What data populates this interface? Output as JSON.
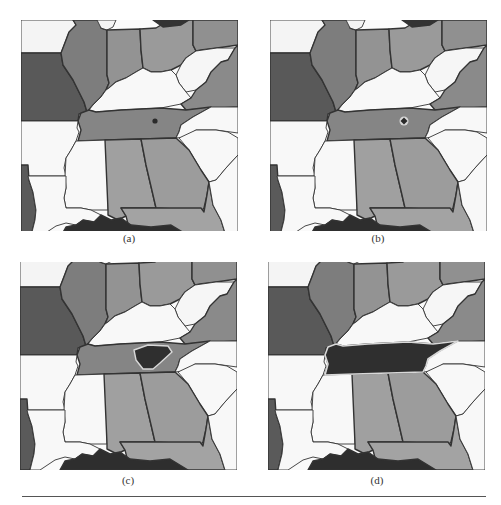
{
  "figure": {
    "panels": [
      {
        "id": "a",
        "caption": "(a)",
        "state_of_interaction": "point marker placed in Tennessee",
        "marker": "dot"
      },
      {
        "id": "b",
        "caption": "(b)",
        "state_of_interaction": "point marker highlighted",
        "marker": "ringed-diamond"
      },
      {
        "id": "c",
        "caption": "(c)",
        "state_of_interaction": "partial region grown inside Tennessee",
        "marker": "partial-region"
      },
      {
        "id": "d",
        "caption": "(d)",
        "state_of_interaction": "full Tennessee region selected and outlined",
        "marker": "full-region"
      }
    ]
  },
  "map": {
    "states": [
      {
        "name": "northwest-white",
        "shade": "#f4f4f4"
      },
      {
        "name": "missouri",
        "shade": "#595959"
      },
      {
        "name": "illinois",
        "shade": "#7d7d7d"
      },
      {
        "name": "lake-michigan",
        "shade": "#f4f4f4"
      },
      {
        "name": "indiana",
        "shade": "#939393"
      },
      {
        "name": "ohio",
        "shade": "#9a9a9a"
      },
      {
        "name": "lake-erie",
        "shade": "#333333"
      },
      {
        "name": "pennsylvania",
        "shade": "#909090"
      },
      {
        "name": "west-virginia",
        "shade": "#f6f6f6"
      },
      {
        "name": "kentucky",
        "shade": "#f8f8f8"
      },
      {
        "name": "virginia",
        "shade": "#8a8a8a"
      },
      {
        "name": "tennessee",
        "shade": "#858585"
      },
      {
        "name": "north-carolina",
        "shade": "#f8f8f8"
      },
      {
        "name": "south-carolina",
        "shade": "#f8f8f8"
      },
      {
        "name": "arkansas",
        "shade": "#f8f8f8"
      },
      {
        "name": "mississippi",
        "shade": "#f8f8f8"
      },
      {
        "name": "alabama",
        "shade": "#a0a0a0"
      },
      {
        "name": "georgia",
        "shade": "#9c9c9c"
      },
      {
        "name": "florida",
        "shade": "#a3a3a3"
      },
      {
        "name": "atlantic",
        "shade": "#f8f8f8"
      },
      {
        "name": "texas",
        "shade": "#5a5a5a"
      },
      {
        "name": "louisiana",
        "shade": "#f8f8f8"
      },
      {
        "name": "gulf-of-mexico",
        "shade": "#2e2e2e"
      }
    ],
    "highlight_color": "#2f2f2f",
    "outline_color": "#d8d8d8",
    "border_color": "#333333"
  }
}
